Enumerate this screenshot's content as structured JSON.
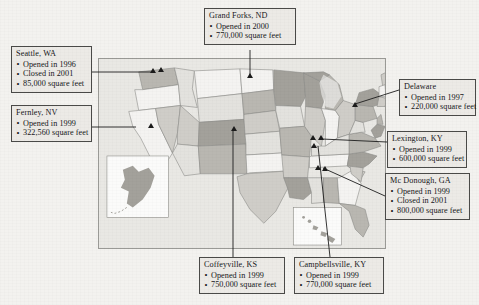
{
  "figure": {
    "kind": "annotated-us-map",
    "map_panel": {
      "background_color": "#e9e8e4",
      "border_color": "#9a9a96",
      "insets": [
        "alaska-inset",
        "hawaii-inset"
      ],
      "marker_glyph": "triangle-marker",
      "marker_color": "#1b1b1b"
    },
    "callouts": [
      {
        "id": "grand-forks-nd",
        "title": "Grand Forks, ND",
        "lines": [
          "Opened in 2000",
          "770,000 square feet"
        ]
      },
      {
        "id": "seattle-wa",
        "title": "Seattle, WA",
        "lines": [
          "Opened in 1996",
          "Closed in 2001",
          "85,000 square feet"
        ]
      },
      {
        "id": "fernley-nv",
        "title": "Fernley, NV",
        "lines": [
          "Opened in 1999",
          "322,560 square feet"
        ]
      },
      {
        "id": "delaware",
        "title": "Delaware",
        "lines": [
          "Opened in 1997",
          "220,000 square feet"
        ]
      },
      {
        "id": "lexington-ky",
        "title": "Lexington, KY",
        "lines": [
          "Opened in 1999",
          "600,000 square feet"
        ]
      },
      {
        "id": "mc-donough-ga",
        "title": "Mc Donough, GA",
        "lines": [
          "Opened in 1999",
          "Closed in 2001",
          "800,000 square feet"
        ]
      },
      {
        "id": "coffeyville-ks",
        "title": "Coffeyville, KS",
        "lines": [
          "Opened in 1999",
          "750,000 square feet"
        ]
      },
      {
        "id": "campbellsville-ky",
        "title": "Campbellsville, KY",
        "lines": [
          "Opened in 1999",
          "770,000 square feet"
        ]
      }
    ]
  }
}
